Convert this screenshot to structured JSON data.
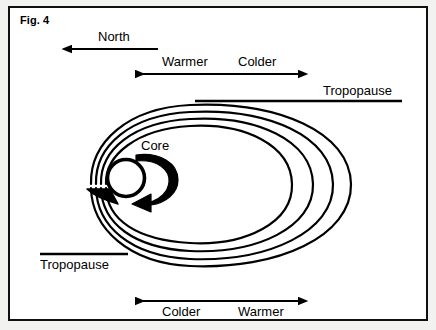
{
  "figure": {
    "label": "Fig. 4",
    "caption_position": "top-left"
  },
  "annotations": {
    "north": {
      "label": "North",
      "arrow": "single-left",
      "icon": "arrow-left-icon"
    },
    "top_gradient": {
      "left_label": "Warmer",
      "right_label": "Colder",
      "arrow": "double-headed-horizontal",
      "labels_position": "above",
      "icon": "arrow-double-horizontal-icon"
    },
    "bottom_gradient": {
      "left_label": "Colder",
      "right_label": "Warmer",
      "arrow": "double-headed-horizontal",
      "labels_position": "below",
      "icon": "arrow-double-horizontal-icon"
    },
    "tropopause_top": {
      "label": "Tropopause",
      "label_position": "above-line"
    },
    "tropopause_bottom": {
      "label": "Tropopause",
      "label_position": "below-line"
    },
    "core": {
      "label": "Core",
      "rotation": "clockwise",
      "icon": "circular-arrow-icon"
    }
  },
  "streamlines": {
    "count": 4,
    "shape": "nested-open-ellipses",
    "opening_side": "left",
    "flow_direction": "inward-toward-core",
    "stroke_color": "#000000"
  },
  "colors": {
    "ink": "#000000",
    "frame": "#101010",
    "page": "#ffffff",
    "outer_mat": "#f2f2f0"
  }
}
